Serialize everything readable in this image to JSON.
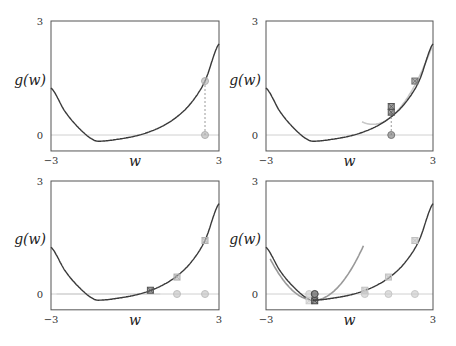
{
  "chart_data": [
    {
      "type": "line",
      "panel": "top-left",
      "title": "",
      "xlabel": "w",
      "ylabel": "g(w)",
      "xlim": [
        -3,
        3
      ],
      "ylim": [
        -0.42,
        3
      ],
      "xticks": [
        "-3",
        "3"
      ],
      "yticks": [
        "0",
        "3"
      ],
      "function_samples": {
        "w": [
          -3,
          -2.5,
          -2,
          -1.5,
          -1.18,
          -0.5,
          0,
          0.5,
          1,
          1.5,
          2,
          2.5,
          3
        ],
        "g": [
          1.24,
          0.62,
          0.18,
          -0.12,
          -0.16,
          -0.1,
          -0.03,
          0.08,
          0.24,
          0.48,
          0.84,
          1.42,
          2.4
        ]
      },
      "zero_line": 0,
      "points": [
        {
          "w": 2.5,
          "g": 1.42,
          "marker": "circle",
          "color": "#b0b0b0",
          "on": "curve"
        },
        {
          "w": 2.5,
          "g": 0,
          "marker": "circle",
          "color": "#b0b0b0",
          "on": "axis"
        }
      ],
      "dashed_connectors": [
        {
          "w": 2.5,
          "from": 0,
          "to": 1.42
        }
      ]
    },
    {
      "type": "line",
      "panel": "top-right",
      "xlabel": "w",
      "ylabel": "g(w)",
      "xlim": [
        -3,
        3
      ],
      "ylim": [
        -0.42,
        3
      ],
      "xticks": [
        "-3",
        "3"
      ],
      "yticks": [
        "0",
        "3"
      ],
      "zero_line": 0,
      "approximation": {
        "kind": "quadratic",
        "center": 1.5,
        "w_range": [
          0.45,
          3
        ],
        "color": "#c8c8c8"
      },
      "points": [
        {
          "w": 2.35,
          "g": 1.42,
          "marker": "x-square",
          "color": "#707070"
        },
        {
          "w": 1.5,
          "g": 0.6,
          "marker": "x-square",
          "color": "#555555"
        },
        {
          "w": 1.5,
          "g": 0.75,
          "marker": "x-square",
          "color": "#555555"
        },
        {
          "w": 1.5,
          "g": 0,
          "marker": "circle",
          "color": "#777777"
        }
      ],
      "dashed_connectors": [
        {
          "w": 1.5,
          "from": 0,
          "to": 0.6
        }
      ]
    },
    {
      "type": "line",
      "panel": "bottom-left",
      "xlabel": "w",
      "ylabel": "g(w)",
      "xlim": [
        -3,
        3
      ],
      "ylim": [
        -0.42,
        3
      ],
      "xticks": [
        "-3",
        "3"
      ],
      "yticks": [
        "0",
        "3"
      ],
      "zero_line": 0,
      "approximation": {
        "kind": "linear-flat",
        "w_range": [
          -2.8,
          0.9
        ],
        "color": "#d8d8d8"
      },
      "points": [
        {
          "w": 2.5,
          "g": 1.42,
          "marker": "x-square",
          "color": "#b0b0b0"
        },
        {
          "w": 1.5,
          "g": 0.45,
          "marker": "x-square",
          "color": "#b0b0b0"
        },
        {
          "w": 0.55,
          "g": 0.1,
          "marker": "x-square",
          "color": "#555555"
        },
        {
          "w": 2.5,
          "g": 0,
          "marker": "circle",
          "color": "#c0c0c0"
        },
        {
          "w": 1.5,
          "g": 0,
          "marker": "circle",
          "color": "#c0c0c0"
        }
      ]
    },
    {
      "type": "line",
      "panel": "bottom-right",
      "xlabel": "w",
      "ylabel": "g(w)",
      "xlim": [
        -3,
        3
      ],
      "ylim": [
        -0.42,
        3
      ],
      "xticks": [
        "-3",
        "3"
      ],
      "yticks": [
        "0",
        "3"
      ],
      "zero_line": 0,
      "approximation": {
        "kind": "quadratic",
        "center": -1.25,
        "w_range": [
          -2.85,
          0.5
        ],
        "color": "#999999"
      },
      "points": [
        {
          "w": 2.35,
          "g": 1.42,
          "marker": "x-square",
          "color": "#c0c0c0"
        },
        {
          "w": 1.4,
          "g": 0.45,
          "marker": "x-square",
          "color": "#c0c0c0"
        },
        {
          "w": 0.55,
          "g": 0.1,
          "marker": "x-square",
          "color": "#c0c0c0"
        },
        {
          "w": -1.45,
          "g": -0.18,
          "marker": "x-square",
          "color": "#cccccc"
        },
        {
          "w": -1.25,
          "g": -0.18,
          "marker": "x-square",
          "color": "#444444"
        },
        {
          "w": 2.35,
          "g": 0,
          "marker": "circle",
          "color": "#c8c8c8"
        },
        {
          "w": 1.4,
          "g": 0,
          "marker": "circle",
          "color": "#c8c8c8"
        },
        {
          "w": 0.55,
          "g": 0,
          "marker": "circle",
          "color": "#c8c8c8"
        },
        {
          "w": -1.45,
          "g": 0,
          "marker": "circle",
          "color": "#cccccc"
        },
        {
          "w": -1.25,
          "g": 0,
          "marker": "circle",
          "color": "#444444"
        }
      ]
    }
  ],
  "colors": {
    "curve": "#3a3a3a",
    "axis": "#555555",
    "zero_line": "#d0d0d0"
  }
}
